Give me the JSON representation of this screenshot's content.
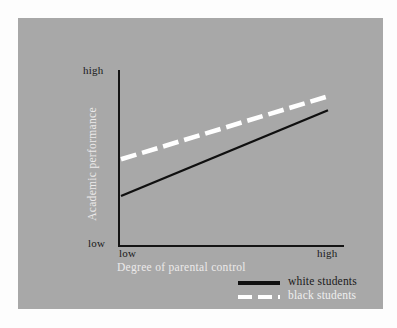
{
  "figure": {
    "background_color": "#fdfdfd",
    "panel_color": "#a8a8a8"
  },
  "chart_data": {
    "type": "line",
    "title": "",
    "subtitle": "",
    "xlabel": "Degree of parental control",
    "ylabel": "Academic performance",
    "xlim": [
      0,
      1
    ],
    "ylim": [
      0,
      1
    ],
    "xtick_labels": [
      "low",
      "high"
    ],
    "ytick_labels": [
      "low",
      "high"
    ],
    "grid": false,
    "legend_position": "bottom-right",
    "annotations": [],
    "series": [
      {
        "name": "white students",
        "style": "solid",
        "color": "#101010",
        "x": [
          0,
          1
        ],
        "values": [
          0.28,
          0.77
        ]
      },
      {
        "name": "black students",
        "style": "dashed",
        "color": "#ffffff",
        "x": [
          0,
          1
        ],
        "values": [
          0.49,
          0.85
        ]
      }
    ]
  },
  "axes": {
    "y_high_label": "high",
    "y_low_label": "low",
    "x_low_label": "low",
    "x_high_label": "high",
    "x_title": "Degree of parental control",
    "y_title": "Academic performance"
  },
  "legend": {
    "items": [
      {
        "label": "white students",
        "style": "solid",
        "color": "#101010"
      },
      {
        "label": "black students",
        "style": "dashed",
        "color": "#ffffff"
      }
    ]
  }
}
